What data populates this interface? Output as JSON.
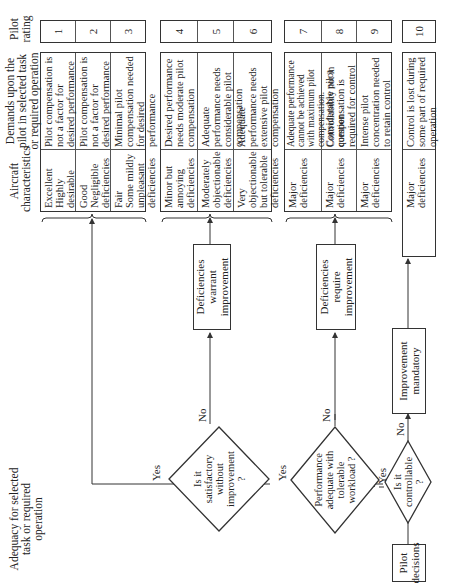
{
  "headers": {
    "adequacy": "Adequacy for selected task or required operation",
    "aircraft": "Aircraft characteristics",
    "demands": "Demands upon the pilot in selected task or required operation",
    "rating": "Pilot rating"
  },
  "groups": [
    {
      "rows": [
        {
          "aircraft": "Excellent\nHighly desirable",
          "demands": "Pilot compensation is not a factor for desired performance",
          "rating": "1"
        },
        {
          "aircraft": "Good\nNegligible deficiencies",
          "demands": "Pilot compensation is not a factor for desired performance",
          "rating": "2"
        },
        {
          "aircraft": "Fair\nSome mildly unpleasant deficiencies",
          "demands": "Minimal pilot compensation needed for desired performance",
          "rating": "3"
        }
      ]
    },
    {
      "rows": [
        {
          "aircraft": "Minor but annoying deficiencies",
          "demands": "Desired performance needs moderate pilot compensation",
          "rating": "4"
        },
        {
          "aircraft": "Moderately objectionable deficiencies",
          "demands": "Adequate performance needs considerable pilot compensation",
          "rating": "5"
        },
        {
          "aircraft": "Very objectionable but tolerable deficiencies",
          "demands": "Adequate performance needs extensive pilot compensation",
          "rating": "6"
        }
      ]
    },
    {
      "rows": [
        {
          "aircraft": "Major deficiencies",
          "demands": "Adequate performance cannot be achieved with maximum pilot compensation. Controllability not in question",
          "rating": "7"
        },
        {
          "aircraft": "Major deficiencies",
          "demands": "Considerable pilot compensation is required for control",
          "rating": "8"
        },
        {
          "aircraft": "Major deficiencies",
          "demands": "Intense pilot concentration needed to retain control",
          "rating": "9"
        }
      ]
    },
    {
      "rows": [
        {
          "aircraft": "Major deficiencies",
          "demands": "Control is lost during some part of required operation",
          "rating": "10"
        }
      ]
    }
  ],
  "flow": {
    "start": "Pilot decisions",
    "q_controllable": "Is it controllable ?",
    "q_performance": "Performance adequate with tolerable workload ?",
    "q_satisfactory": "Is it satisfactory without improvement ?",
    "box_mandatory": "Improvement mandatory",
    "box_require": "Deficiencies require improvement",
    "box_warrant": "Deficiencies warrant improvement",
    "yes": "Yes",
    "no": "No"
  }
}
